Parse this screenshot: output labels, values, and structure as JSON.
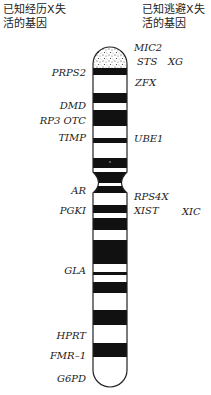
{
  "headers": {
    "left": "已知经历X失活的基因",
    "left_line1": "已知经历X失",
    "left_line2": "活的基因",
    "right_line1": "已知逃避X失",
    "right_line2": "活的基因"
  },
  "left_genes": [
    {
      "id": "prps2",
      "label": "PRPS2",
      "right": 86,
      "top": 67
    },
    {
      "id": "dmd",
      "label": "DMD",
      "right": 86,
      "top": 100
    },
    {
      "id": "rp3-otc",
      "label": "RP3 OTC",
      "right": 86,
      "top": 115
    },
    {
      "id": "timp",
      "label": "TIMP",
      "right": 86,
      "top": 132
    },
    {
      "id": "ar",
      "label": "AR",
      "right": 86,
      "top": 185
    },
    {
      "id": "pgki",
      "label": "PGKI",
      "right": 86,
      "top": 205
    },
    {
      "id": "gla",
      "label": "GLA",
      "right": 86,
      "top": 265
    },
    {
      "id": "hprt",
      "label": "HPRT",
      "right": 86,
      "top": 330
    },
    {
      "id": "fmr-1",
      "label": "FMR–1",
      "right": 86,
      "top": 350
    },
    {
      "id": "g6pd",
      "label": "G6PD",
      "right": 86,
      "top": 373
    }
  ],
  "right_genes": [
    {
      "id": "mic2",
      "label": "MIC2",
      "left": 134,
      "top": 42
    },
    {
      "id": "sts",
      "label": "STS",
      "left": 137,
      "top": 56
    },
    {
      "id": "xg",
      "label": "XG",
      "left": 168,
      "top": 56
    },
    {
      "id": "zfx",
      "label": "ZFX",
      "left": 135,
      "top": 77
    },
    {
      "id": "ube1",
      "label": "UBE1",
      "left": 134,
      "top": 133
    },
    {
      "id": "rps4x",
      "label": "RPS4X",
      "left": 134,
      "top": 191
    },
    {
      "id": "xist",
      "label": "XIST",
      "left": 134,
      "top": 205
    },
    {
      "id": "xic",
      "label": "XIC",
      "left": 182,
      "top": 206
    }
  ],
  "chromosome": {
    "x": 93,
    "width": 34,
    "top": 47,
    "bottom": 387,
    "band_color": "#111111",
    "outline_color": "#222222",
    "dark_bands": [
      [
        68,
        75
      ],
      [
        93,
        103
      ],
      [
        110,
        126
      ],
      [
        138,
        143
      ],
      [
        158,
        168
      ],
      [
        205,
        213
      ],
      [
        218,
        230
      ],
      [
        240,
        264
      ],
      [
        272,
        275
      ],
      [
        282,
        293
      ],
      [
        310,
        325
      ],
      [
        343,
        357
      ]
    ],
    "centromere": {
      "top": 172,
      "waist": 183,
      "bottom": 193
    }
  }
}
